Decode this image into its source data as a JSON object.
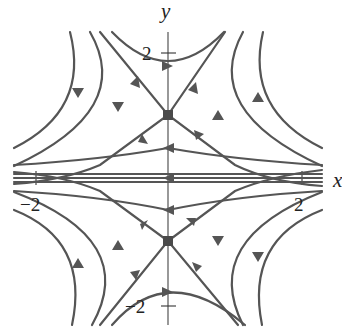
{
  "figure": {
    "type": "phase-portrait",
    "axes": {
      "x_label": "x",
      "y_label": "y",
      "x_ticks": [
        {
          "value": -2,
          "label": "−2"
        },
        {
          "value": 2,
          "label": "2"
        }
      ],
      "y_ticks": [
        {
          "value": 2,
          "label": "2"
        },
        {
          "value": -2,
          "label": "−2"
        }
      ]
    },
    "equilibria": [
      {
        "x": 0,
        "y": 1,
        "kind": "saddle"
      },
      {
        "x": 0,
        "y": -1,
        "kind": "saddle"
      }
    ],
    "colors": {
      "curve": "#555555",
      "axis": "#444444",
      "background": "#ffffff"
    }
  }
}
